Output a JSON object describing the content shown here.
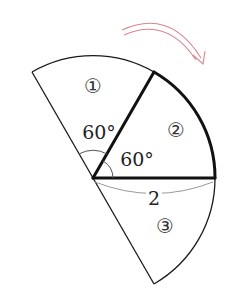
{
  "diagram": {
    "type": "geometry-sectors",
    "center": {
      "x": 93,
      "y": 178
    },
    "radius_px": 122,
    "sectors": [
      {
        "id": "sector-1",
        "label": "①",
        "from_deg": 60,
        "to_deg": 120,
        "angle_label": "60°"
      },
      {
        "id": "sector-2",
        "label": "②",
        "from_deg": 0,
        "to_deg": 60,
        "angle_label": "60°",
        "emphasized": true
      },
      {
        "id": "sector-3",
        "label": "③",
        "from_deg": -60,
        "to_deg": 0
      }
    ],
    "radius_label": "2",
    "arrow": {
      "direction": "clockwise",
      "color": "#d9848f"
    },
    "colors": {
      "stroke": "#1a1a1a",
      "dimension": "#999999",
      "arrow": "#d9848f"
    }
  },
  "labels": {
    "sector1": "①",
    "sector2": "②",
    "sector3": "③",
    "angle1": "60°",
    "angle2": "60°",
    "radius": "2"
  }
}
